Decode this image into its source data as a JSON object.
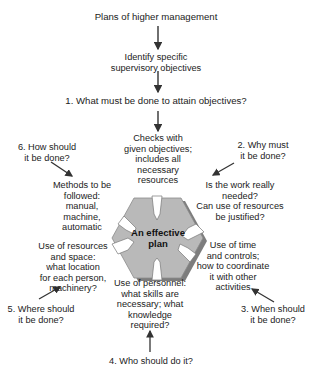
{
  "diagram": {
    "title_node": "Plans of higher management",
    "step_node": [
      "Identify specific",
      "supervisory objectives"
    ],
    "question_1": "1. What must be done to attain objectives?",
    "center": [
      "An effective",
      "plan"
    ],
    "answers": {
      "what": [
        "Checks with",
        "given objectives;",
        "includes all",
        "necessary",
        "resources"
      ],
      "why": [
        "Is the work really",
        "needed?",
        "Can use of resources",
        "be justified?"
      ],
      "when": [
        "Use of time",
        "and controls;",
        "how to coordinate",
        "it with other",
        "activities"
      ],
      "who": [
        "Use of personnel:",
        "what skills are",
        "necessary; what",
        "knowledge",
        "required?"
      ],
      "where": [
        "Use of resources",
        "and space:",
        "what location",
        "for each person,",
        "machinery?"
      ],
      "how": [
        "Methods to be",
        "followed:",
        "manual,",
        "machine,",
        "automatic"
      ]
    },
    "questions": {
      "q2": [
        "2. Why must",
        "it be done?"
      ],
      "q3": [
        "3. When should",
        "it be done?"
      ],
      "q4": "4. Who should do it?",
      "q5": [
        "5. Where should",
        "it be done?"
      ],
      "q6": [
        "6. How should",
        "it be done?"
      ]
    },
    "colors": {
      "shape_face": "#b9b9b9",
      "shape_side": "#7d7d7d",
      "arrow": "#333333",
      "text": "#222222"
    }
  }
}
